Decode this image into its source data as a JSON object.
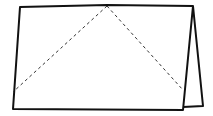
{
  "diagram": {
    "type": "folded-paper-illustration",
    "stroke_color": "#111111",
    "fold_line_color": "#333333",
    "background": "#ffffff",
    "front_panel": {
      "points": "20,7 193,6 183,110 13,109"
    },
    "back_flap": {
      "points": "193,6 203,106 183,107"
    },
    "fold_lines": [
      {
        "x1": 107,
        "y1": 6,
        "x2": 13,
        "y2": 92
      },
      {
        "x1": 107,
        "y1": 6,
        "x2": 183,
        "y2": 90
      }
    ]
  }
}
